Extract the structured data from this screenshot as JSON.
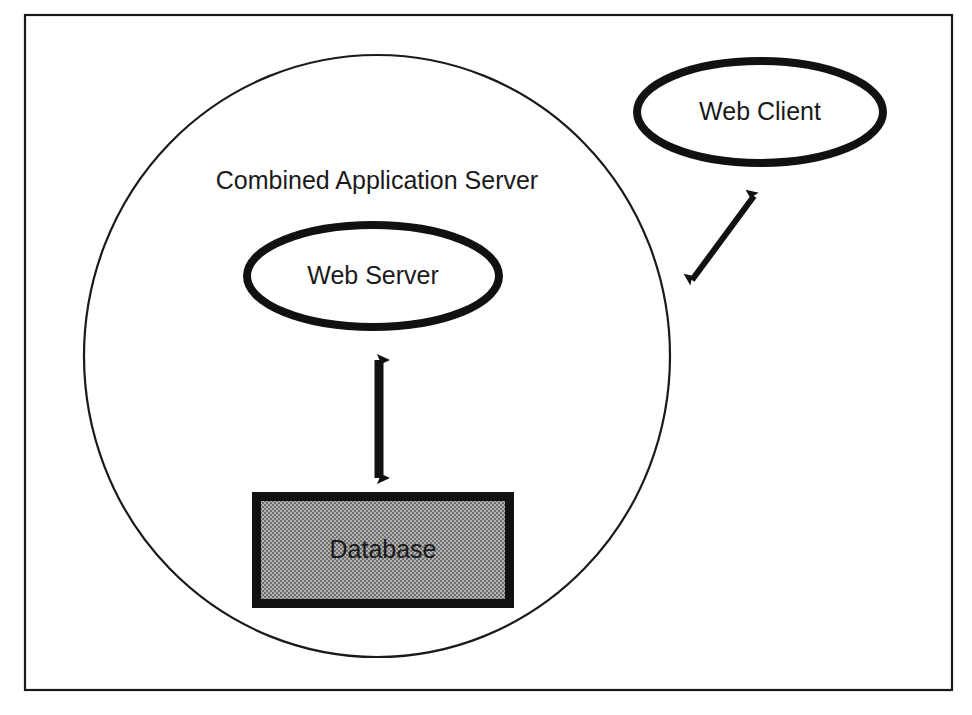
{
  "figure": {
    "type": "architecture-diagram",
    "title": "Combined Application Server",
    "background_color": "#ffffff",
    "frame": {
      "name": "outer-frame",
      "x": 24,
      "y": 14,
      "width": 928,
      "height": 676,
      "stroke_color": "#1a1a1a",
      "stroke_width": 2,
      "fill": "none"
    },
    "boundary": {
      "name": "combined-application-server-boundary",
      "label": "Combined Application Server",
      "shape": "ellipse",
      "cx": 377,
      "cy": 356,
      "rx": 293,
      "ry": 301,
      "stroke_color": "#1a1a1a",
      "stroke_width": 2,
      "fill": "none",
      "label_x": 377,
      "label_y": 182
    },
    "nodes": [
      {
        "id": "web-server",
        "label": "Web Server",
        "shape": "ellipse",
        "cx": 373,
        "cy": 276,
        "rx": 130,
        "ry": 55,
        "stroke_color": "#111111",
        "stroke_width": 8,
        "fill": "#ffffff",
        "inside_boundary": true
      },
      {
        "id": "web-client",
        "label": "Web Client",
        "shape": "ellipse",
        "cx": 760,
        "cy": 112,
        "rx": 127,
        "ry": 55,
        "stroke_color": "#111111",
        "stroke_width": 8,
        "fill": "#ffffff",
        "inside_boundary": false
      },
      {
        "id": "database",
        "label": "Database",
        "shape": "rectangle",
        "x": 252,
        "y": 492,
        "width": 262,
        "height": 116,
        "stroke_color": "#111111",
        "stroke_width": 9,
        "fill_color": "#9e9e9e",
        "fill_pattern": "halftone-checker",
        "inside_boundary": true
      }
    ],
    "connections": [
      {
        "id": "web-server-to-database",
        "from": "web-server",
        "to": "database",
        "style": "double-headed-arrow",
        "orientation": "vertical",
        "color": "#111111",
        "x1": 379,
        "y1": 358,
        "x2": 379,
        "y2": 482
      },
      {
        "id": "web-client-to-server-boundary",
        "from": "web-client",
        "to": "combined-application-server-boundary",
        "style": "double-headed-arrow",
        "orientation": "diagonal",
        "color": "#111111",
        "x1": 691,
        "y1": 278,
        "x2": 756,
        "y2": 192
      }
    ]
  },
  "labels": {
    "boundary": "Combined Application Server",
    "web_server": "Web Server",
    "web_client": "Web Client",
    "database": "Database"
  }
}
